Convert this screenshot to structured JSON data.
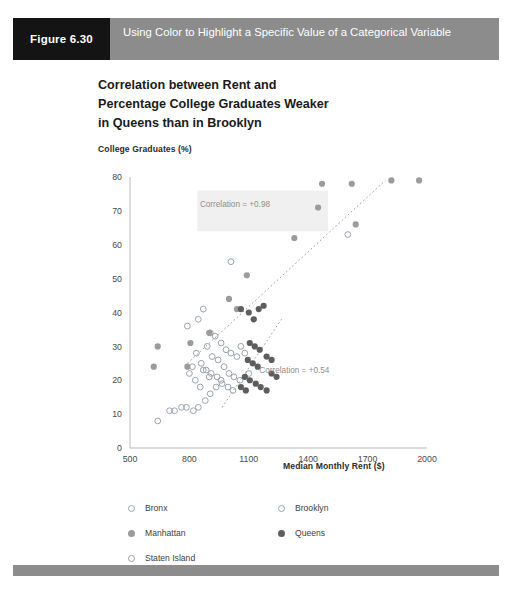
{
  "header": {
    "figure_label": "Figure 6.30",
    "caption": "Using Color to Highlight a Specific Value of a Categorical Variable",
    "tag_bg": "#141414",
    "bar_bg": "#8c8c8c"
  },
  "chart_title_line1": "Correlation between Rent and",
  "chart_title_line2": "Percentage College Graduates Weaker",
  "chart_title_line3": "in Queens than in Brooklyn",
  "legend": {
    "items": [
      {
        "label": "Bronx",
        "marker": "open",
        "color": "#9aa3ad"
      },
      {
        "label": "Brooklyn",
        "marker": "open",
        "color": "#9aa3ad"
      },
      {
        "label": "Manhattan",
        "marker": "mid",
        "color": "#9b9b9b"
      },
      {
        "label": "Queens",
        "marker": "dark",
        "color": "#5d5d5d"
      },
      {
        "label": "Staten Island",
        "marker": "open",
        "color": "#9aa3ad"
      }
    ]
  },
  "chart_data": {
    "type": "scatter",
    "title": "Correlation between Rent and Percentage College Graduates Weaker in Queens than in Brooklyn",
    "xlabel": "Median Monthly Rent ($)",
    "ylabel": "College Graduates (%)",
    "xlim": [
      500,
      2000
    ],
    "ylim": [
      0,
      80
    ],
    "xticks": [
      500,
      800,
      1100,
      1400,
      1700,
      2000
    ],
    "yticks": [
      0,
      10,
      20,
      30,
      40,
      50,
      60,
      70,
      80
    ],
    "grid": false,
    "legend_position": "below-plot",
    "annotations": [
      {
        "text": "Correlation = +0.98",
        "x": 1030,
        "y": 71,
        "series": "Manhattan"
      },
      {
        "text": "Correlation = +0.54",
        "x": 1330,
        "y": 22,
        "series": "Queens"
      }
    ],
    "trendlines": [
      {
        "series": "Manhattan",
        "style": "dotted",
        "x1": 790,
        "y1": 25,
        "x2": 1790,
        "y2": 79
      },
      {
        "series": "Queens",
        "style": "dotted",
        "x1": 965,
        "y1": 12,
        "x2": 1265,
        "y2": 38
      }
    ],
    "series": [
      {
        "name": "Bronx",
        "marker": "open-circle",
        "color": "#9aa3ad",
        "points": [
          [
            640,
            8
          ],
          [
            700,
            11
          ],
          [
            725,
            11
          ],
          [
            760,
            12
          ],
          [
            785,
            12
          ],
          [
            820,
            11
          ],
          [
            845,
            12
          ],
          [
            880,
            14
          ],
          [
            905,
            16
          ],
          [
            855,
            18
          ],
          [
            830,
            20
          ],
          [
            900,
            21
          ],
          [
            935,
            18
          ],
          [
            870,
            23
          ],
          [
            960,
            20
          ]
        ]
      },
      {
        "name": "Brooklyn",
        "marker": "open-circle",
        "color": "#9aa3ad",
        "points": [
          [
            790,
            36
          ],
          [
            845,
            38
          ],
          [
            870,
            41
          ],
          [
            905,
            34
          ],
          [
            930,
            33
          ],
          [
            960,
            31
          ],
          [
            985,
            29
          ],
          [
            1010,
            28
          ],
          [
            1040,
            27
          ],
          [
            890,
            30
          ],
          [
            915,
            27
          ],
          [
            945,
            26
          ],
          [
            975,
            24
          ],
          [
            1000,
            22
          ],
          [
            1025,
            21
          ],
          [
            860,
            25
          ],
          [
            885,
            23
          ],
          [
            910,
            22
          ],
          [
            940,
            21
          ],
          [
            965,
            19
          ],
          [
            995,
            18
          ],
          [
            1020,
            17
          ],
          [
            1060,
            30
          ],
          [
            1080,
            28
          ],
          [
            1100,
            22
          ],
          [
            1055,
            20
          ],
          [
            835,
            28
          ],
          [
            815,
            24
          ],
          [
            800,
            22
          ]
        ]
      },
      {
        "name": "Staten Island",
        "marker": "open-circle",
        "color": "#9aa3ad",
        "points": [
          [
            1010,
            55
          ],
          [
            1600,
            63
          ]
        ]
      },
      {
        "name": "Manhattan",
        "marker": "filled-circle",
        "color": "#9b9b9b",
        "points": [
          [
            620,
            24
          ],
          [
            640,
            30
          ],
          [
            790,
            24
          ],
          [
            805,
            31
          ],
          [
            900,
            34
          ],
          [
            1000,
            44
          ],
          [
            1040,
            41
          ],
          [
            1090,
            51
          ],
          [
            1330,
            62
          ],
          [
            1450,
            71
          ],
          [
            1470,
            78
          ],
          [
            1620,
            78
          ],
          [
            1640,
            66
          ],
          [
            1820,
            79
          ],
          [
            1960,
            79
          ]
        ]
      },
      {
        "name": "Queens",
        "marker": "filled-circle",
        "color": "#5d5d5d",
        "points": [
          [
            1060,
            41
          ],
          [
            1100,
            40
          ],
          [
            1125,
            38
          ],
          [
            1150,
            41
          ],
          [
            1175,
            42
          ],
          [
            1105,
            31
          ],
          [
            1130,
            30
          ],
          [
            1155,
            29
          ],
          [
            1095,
            26
          ],
          [
            1120,
            25
          ],
          [
            1145,
            24
          ],
          [
            1080,
            21
          ],
          [
            1105,
            20
          ],
          [
            1135,
            19
          ],
          [
            1160,
            18
          ],
          [
            1190,
            17
          ],
          [
            1215,
            22
          ],
          [
            1240,
            21
          ],
          [
            1190,
            27
          ],
          [
            1215,
            26
          ],
          [
            1060,
            18
          ],
          [
            1085,
            17
          ]
        ]
      }
    ]
  }
}
